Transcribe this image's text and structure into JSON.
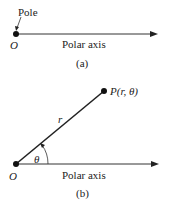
{
  "diagram_a": {
    "pole_label": "Pole",
    "origin_label": "O",
    "axis_label": "Polar axis",
    "caption": "(a)"
  },
  "diagram_b": {
    "point_label": "P(r, θ)",
    "radius_label": "r",
    "angle_label": "θ",
    "origin_label": "O",
    "axis_label": "Polar axis",
    "caption": "(b)"
  },
  "colors": {
    "line": "#333333",
    "text": "#222222"
  }
}
